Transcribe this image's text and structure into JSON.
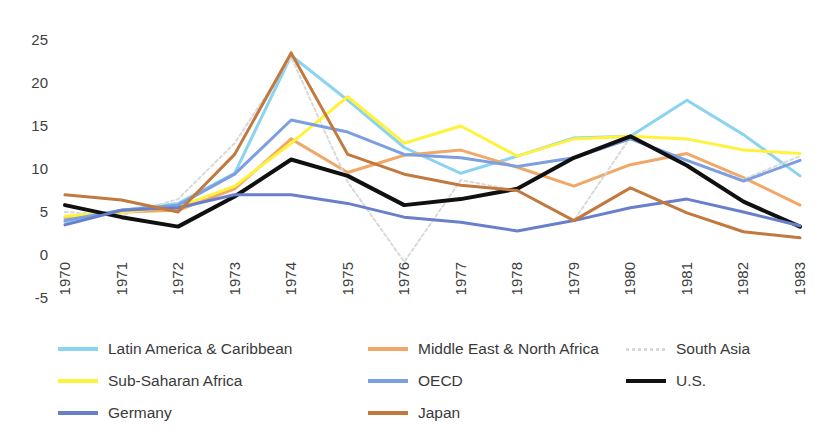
{
  "chart_data": {
    "type": "line",
    "title": "",
    "xlabel": "",
    "ylabel": "",
    "x": [
      1970,
      1971,
      1972,
      1973,
      1974,
      1975,
      1976,
      1977,
      1978,
      1979,
      1980,
      1981,
      1982,
      1983
    ],
    "categories": [
      "1970",
      "1971",
      "1972",
      "1973",
      "1974",
      "1975",
      "1976",
      "1977",
      "1978",
      "1979",
      "1980",
      "1981",
      "1982",
      "1983"
    ],
    "ylim": [
      -5,
      25
    ],
    "yticks": [
      25,
      20,
      15,
      10,
      5,
      0,
      -5
    ],
    "ytick_labels": [
      "25",
      "20",
      "15",
      "10",
      "5",
      "0",
      "-5"
    ],
    "grid": false,
    "legend_position": "bottom",
    "series": [
      {
        "name": "Latin America & Caribbean",
        "color": "#8BD3EE",
        "width": 3,
        "dashed": false,
        "values": [
          3.8,
          5.2,
          6.0,
          9.5,
          23.2,
          18.0,
          12.5,
          9.5,
          11.5,
          13.6,
          13.8,
          18.0,
          14.0,
          9.2
        ]
      },
      {
        "name": "Middle East & North Africa",
        "color": "#F0A868",
        "width": 3,
        "dashed": false,
        "values": [
          4.3,
          5.0,
          5.2,
          7.7,
          13.5,
          9.6,
          11.6,
          12.2,
          10.2,
          8.0,
          10.5,
          11.8,
          9.0,
          5.8
        ]
      },
      {
        "name": "South Asia",
        "color": "#D9D9D9",
        "width": 2,
        "dashed": true,
        "values": [
          5.0,
          4.6,
          6.5,
          13.0,
          23.0,
          8.5,
          -0.8,
          8.7,
          7.5,
          4.0,
          13.7,
          11.0,
          8.8,
          11.5
        ]
      },
      {
        "name": "Sub-Saharan Africa",
        "color": "#FFF23C",
        "width": 3,
        "dashed": false,
        "values": [
          4.5,
          5.0,
          5.6,
          8.0,
          13.0,
          18.4,
          13.0,
          15.0,
          11.5,
          13.5,
          13.8,
          13.5,
          12.2,
          11.8
        ]
      },
      {
        "name": "OECD",
        "color": "#7B9FE0",
        "width": 3,
        "dashed": false,
        "values": [
          4.0,
          5.2,
          5.8,
          9.4,
          15.7,
          14.3,
          11.7,
          11.3,
          10.3,
          11.3,
          13.5,
          11.0,
          8.6,
          11.0
        ]
      },
      {
        "name": "U.S.",
        "color": "#101010",
        "width": 4,
        "dashed": false,
        "values": [
          5.8,
          4.4,
          3.3,
          6.8,
          11.1,
          9.2,
          5.8,
          6.5,
          7.7,
          11.3,
          13.8,
          10.4,
          6.2,
          3.3
        ]
      },
      {
        "name": "Germany",
        "color": "#6A7FCB",
        "width": 3,
        "dashed": false,
        "values": [
          3.5,
          5.2,
          5.5,
          7.0,
          7.0,
          6.0,
          4.4,
          3.8,
          2.8,
          4.0,
          5.5,
          6.5,
          5.0,
          3.4
        ]
      },
      {
        "name": "Japan",
        "color": "#C1793E",
        "width": 3,
        "dashed": false,
        "values": [
          7.0,
          6.4,
          5.0,
          11.7,
          23.5,
          11.7,
          9.4,
          8.1,
          7.5,
          4.0,
          7.8,
          4.9,
          2.7,
          2.0
        ]
      }
    ]
  },
  "legend": {
    "rows": [
      [
        {
          "label": "Latin America & Caribbean",
          "color": "#8BD3EE",
          "dashed": false,
          "x": 0
        },
        {
          "label": "Middle East & North Africa",
          "color": "#F0A868",
          "dashed": false,
          "x": 310
        },
        {
          "label": "South Asia",
          "color": "#D9D9D9",
          "dashed": true,
          "x": 568
        }
      ],
      [
        {
          "label": "Sub-Saharan Africa",
          "color": "#FFF23C",
          "dashed": false,
          "x": 0
        },
        {
          "label": "OECD",
          "color": "#7B9FE0",
          "dashed": false,
          "x": 310
        },
        {
          "label": "U.S.",
          "color": "#101010",
          "dashed": false,
          "x": 568
        }
      ],
      [
        {
          "label": "Germany",
          "color": "#6A7FCB",
          "dashed": false,
          "x": 0
        },
        {
          "label": "Japan",
          "color": "#C1793E",
          "dashed": false,
          "x": 310
        }
      ]
    ]
  }
}
